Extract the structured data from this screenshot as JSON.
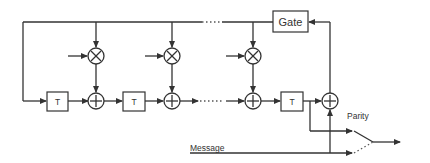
{
  "diagram": {
    "type": "LFSR parity generator (systematic cyclic encoder)",
    "blocks": {
      "gate": "Gate",
      "delay": "T"
    },
    "labels": {
      "parity": "Parity",
      "message": "Message"
    },
    "components": [
      {
        "kind": "delay",
        "label": "T",
        "position": "stage-1"
      },
      {
        "kind": "multiplier",
        "symbol": "⊗",
        "position": "stage-1"
      },
      {
        "kind": "adder",
        "symbol": "⊕",
        "position": "stage-1"
      },
      {
        "kind": "delay",
        "label": "T",
        "position": "stage-2"
      },
      {
        "kind": "multiplier",
        "symbol": "⊗",
        "position": "stage-2"
      },
      {
        "kind": "adder",
        "symbol": "⊕",
        "position": "stage-2"
      },
      {
        "kind": "multiplier",
        "symbol": "⊗",
        "position": "stage-n"
      },
      {
        "kind": "adder",
        "symbol": "⊕",
        "position": "stage-n"
      },
      {
        "kind": "delay",
        "label": "T",
        "position": "stage-n"
      },
      {
        "kind": "adder",
        "symbol": "⊕",
        "position": "output"
      },
      {
        "kind": "gate",
        "label": "Gate",
        "position": "feedback"
      },
      {
        "kind": "switch",
        "position": "output",
        "inputs": [
          "Parity",
          "Message"
        ]
      }
    ]
  }
}
